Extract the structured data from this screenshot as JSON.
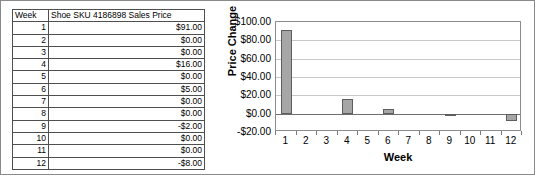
{
  "table": {
    "headers": [
      "Week",
      "Shoe SKU 4186898 Sales Price"
    ],
    "rows": [
      {
        "week": "1",
        "price": "$91.00"
      },
      {
        "week": "2",
        "price": "$0.00"
      },
      {
        "week": "3",
        "price": "$0.00"
      },
      {
        "week": "4",
        "price": "$16.00"
      },
      {
        "week": "5",
        "price": "$0.00"
      },
      {
        "week": "6",
        "price": "$5.00"
      },
      {
        "week": "7",
        "price": "$0.00"
      },
      {
        "week": "8",
        "price": "$0.00"
      },
      {
        "week": "9",
        "price": "-$2.00"
      },
      {
        "week": "10",
        "price": "$0.00"
      },
      {
        "week": "11",
        "price": "$0.00"
      },
      {
        "week": "12",
        "price": "-$8.00"
      }
    ]
  },
  "chart_data": {
    "type": "bar",
    "title": "",
    "xlabel": "Week",
    "ylabel": "Price Change",
    "categories": [
      "1",
      "2",
      "3",
      "4",
      "5",
      "6",
      "7",
      "8",
      "9",
      "10",
      "11",
      "12"
    ],
    "values": [
      91,
      0,
      0,
      16,
      0,
      5,
      0,
      0,
      -2,
      0,
      0,
      -8
    ],
    "ylim": [
      -20,
      100
    ],
    "ytick_values": [
      100,
      80,
      60,
      40,
      20,
      0,
      -20
    ],
    "ytick_labels": [
      "$100.00",
      "$80.00",
      "$60.00",
      "$40.00",
      "$20.00",
      "$0.00",
      "-$20.00"
    ],
    "grid": true,
    "legend": false,
    "bar_fill_color": "#a6a6a6",
    "bar_border_color": "#5d5d5d",
    "gridline_color": "#c9c9c9"
  }
}
